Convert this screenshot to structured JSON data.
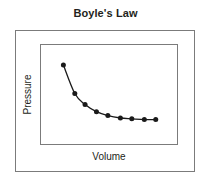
{
  "chart_data": {
    "type": "line",
    "title": "Boyle's Law",
    "xlabel": "Volume",
    "ylabel": "Pressure",
    "grid": false,
    "legend": null,
    "xlim": [
      0,
      10
    ],
    "ylim": [
      0,
      10
    ],
    "axis_ticks": {
      "x": [],
      "y": []
    },
    "series": [
      {
        "name": "Pressure vs Volume",
        "marker": "filled-circle",
        "marker_color": "#1a1a1a",
        "line_color": "#1a1a1a",
        "x": [
          1.0,
          2.0,
          2.9,
          3.9,
          4.9,
          6.0,
          7.0,
          8.1,
          9.1
        ],
        "y": [
          8.6,
          5.0,
          3.6,
          2.7,
          2.2,
          1.9,
          1.8,
          1.7,
          1.7
        ]
      }
    ],
    "annotations": []
  },
  "figure": {
    "title": "Boyle's Law",
    "x_axis_label": "Volume",
    "y_axis_label": "Pressure"
  },
  "colors": {
    "background": "#ffffff",
    "border": "#7b7b7b",
    "text": "#231f20",
    "curve": "#1a1a1a",
    "marker": "#1a1a1a"
  }
}
